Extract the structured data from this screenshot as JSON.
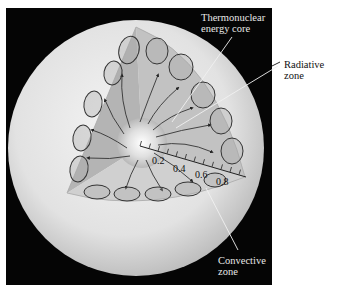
{
  "figure": {
    "background_color": "#050505",
    "sphere_color": "#e6e6e6",
    "wedge_color": "#bdbdbd"
  },
  "labels": {
    "core": {
      "line1": "Thermonuclear",
      "line2": "energy core"
    },
    "radiative": {
      "line1": "Radiative",
      "line2": "zone"
    },
    "convective": {
      "line1": "Convective",
      "line2": "zone"
    }
  },
  "scale": {
    "ticks": [
      "0.2",
      "0.4",
      "0.6",
      "0.8"
    ],
    "minor_tick_count": 12
  },
  "annotations": {
    "convective_loops": 16,
    "radiative_arrows": 16
  }
}
